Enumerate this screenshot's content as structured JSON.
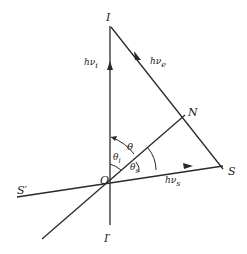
{
  "diagram": {
    "type": "vector-geometry",
    "points": {
      "I": {
        "label": "I",
        "x": 110,
        "y": 22
      },
      "I_prime": {
        "label": "I'",
        "x": 110,
        "y": 225
      },
      "O": {
        "label": "O",
        "x": 110,
        "y": 181
      },
      "N": {
        "label": "N",
        "x": 185,
        "y": 115
      },
      "S": {
        "label": "S",
        "x": 223,
        "y": 169
      },
      "S_prime": {
        "label": "S'",
        "x": 17,
        "y": 197
      },
      "lower_end": {
        "x": 42,
        "y": 239
      }
    },
    "labels": {
      "I": "I",
      "I_prime": "I′",
      "O": "O",
      "N": "N",
      "S": "S",
      "S_prime": "S′",
      "hv_i": "hν",
      "hv_i_sub": "i",
      "hv_e": "hν",
      "hv_e_sub": "e",
      "hv_s": "hν",
      "hv_s_sub": "s",
      "theta": "θ",
      "theta_i": "θ",
      "theta_i_sub": "i",
      "theta_s": "θ",
      "theta_s_sub": "s"
    },
    "edges": [
      {
        "from": "I_prime",
        "to": "I",
        "arrow": "toward I",
        "label": "hν_i"
      },
      {
        "from": "I",
        "to": "S",
        "arrow": "toward S",
        "label": "hν_e"
      },
      {
        "from": "S_prime",
        "to": "S",
        "arrow": "toward S",
        "label": "hν_s"
      },
      {
        "from": "lower_end",
        "to": "N",
        "arrow": "none"
      }
    ],
    "angles": [
      {
        "name": "theta",
        "between": [
          "OI",
          "ON"
        ]
      },
      {
        "name": "theta_i",
        "between": [
          "OI",
          "ON"
        ]
      },
      {
        "name": "theta_s",
        "between": [
          "ON",
          "OS"
        ]
      }
    ],
    "colors": {
      "ink": "#2a2a2a",
      "background": "#ffffff"
    }
  }
}
